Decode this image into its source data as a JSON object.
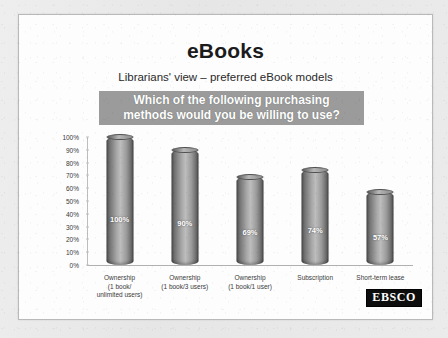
{
  "slide": {
    "title": "eBooks",
    "subtitle": "Librarians' view – preferred eBook models",
    "banner": {
      "line1": "Which of the following purchasing",
      "line2": "methods would you be willing to use?",
      "background_color": "#9b9b9b",
      "text_color": "#ffffff"
    },
    "logo": {
      "text": "EBSCO",
      "background_color": "#0d0d0d",
      "text_color": "#ffffff"
    }
  },
  "chart_data": {
    "type": "bar",
    "title": "Which of the following purchasing methods would you be willing to use?",
    "xlabel": "",
    "ylabel": "",
    "ylim": [
      0,
      100
    ],
    "grid": false,
    "legend": "none",
    "bar_style": "3d-cylinder",
    "categories": [
      "Ownership (1 book/ unlimited users)",
      "Ownership (1 book/3 users)",
      "Ownership (1 book/1 user)",
      "Subscription",
      "Short-term lease"
    ],
    "category_lines": [
      [
        "Ownership",
        "(1 book/",
        "unlimited users)"
      ],
      [
        "Ownership",
        "(1 book/3 users)"
      ],
      [
        "Ownership",
        "(1 book/1 user)"
      ],
      [
        "Subscription"
      ],
      [
        "Short-term lease"
      ]
    ],
    "values": [
      100,
      90,
      69,
      74,
      57
    ],
    "data_labels": [
      "100%",
      "90%",
      "69%",
      "74%",
      "57%"
    ],
    "ytick_labels": [
      "100%",
      "90%",
      "80%",
      "70%",
      "60%",
      "50%",
      "40%",
      "30%",
      "20%",
      "10%",
      "0%"
    ],
    "ytick_values": [
      100,
      90,
      80,
      70,
      60,
      50,
      40,
      30,
      20,
      10,
      0
    ],
    "bar_color": "#a8a8a8"
  }
}
